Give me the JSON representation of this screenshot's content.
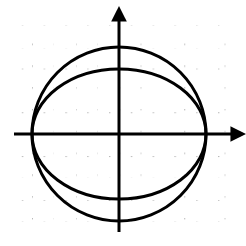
{
  "figure": {
    "background_color": "#ffffff",
    "width": 246,
    "height": 246
  },
  "grid": {
    "style": "dotted",
    "dot_color": "#b9b9b9",
    "dot_spacing_px": 4,
    "cell_size_px": 21.8,
    "left_px": 14,
    "top_px": 25,
    "right_px": 226,
    "bottom_px": 232,
    "columns": 10,
    "rows": 9.5
  },
  "axes": {
    "color": "#000000",
    "line_width_px": 3,
    "origin": {
      "x_px": 119,
      "y_px": 134
    },
    "x_axis": {
      "label": "x",
      "start_px": 14,
      "end_px": 240,
      "arrow": "right",
      "arrow_tip_px": 240
    },
    "y_axis": {
      "label": "y",
      "start_px": 232,
      "end_px": 12,
      "arrow": "up",
      "arrow_tip_px": 12
    }
  },
  "chart_data": {
    "type": "line",
    "xlabel": "x",
    "ylabel": "y",
    "grid": true,
    "legend": "none",
    "xlim": [
      -4.8,
      5.5
    ],
    "ylim": [
      -4.5,
      5.6
    ],
    "series": [
      {
        "name": "circle",
        "shape": "circle",
        "center": [
          0,
          0
        ],
        "radius": 4.0,
        "radius_x": 4.0,
        "radius_y": 4.0,
        "stroke": "#000000",
        "stroke_width_px": 3,
        "center_px": [
          119,
          134
        ],
        "radius_x_px": 87,
        "radius_y_px": 87,
        "equation": "x^2 + y^2 = 16"
      },
      {
        "name": "ellipse",
        "shape": "ellipse",
        "center": [
          0,
          0
        ],
        "radius_x": 4.0,
        "radius_y": 3.0,
        "stroke": "#000000",
        "stroke_width_px": 3,
        "center_px": [
          119,
          134
        ],
        "radius_x_px": 87,
        "radius_y_px": 65,
        "equation": "x^2/16 + y^2/9 = 1"
      }
    ],
    "intersections": [
      {
        "x": -4.0,
        "y": 0.0,
        "x_px": 32,
        "y_px": 134
      },
      {
        "x": 4.0,
        "y": 0.0,
        "x_px": 206,
        "y_px": 134
      }
    ]
  }
}
